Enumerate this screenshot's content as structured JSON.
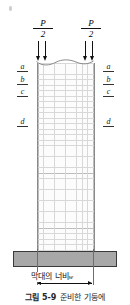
{
  "figure": {
    "title_caption": {
      "number": "그림 5-9",
      "text": "준비한 기둥에"
    },
    "loads": [
      {
        "id": "load-left",
        "numerator": "P",
        "denominator": "2"
      },
      {
        "id": "load-right",
        "numerator": "P",
        "denominator": "2"
      }
    ],
    "side_labels_left": [
      {
        "label": "a",
        "rule": "overline"
      },
      {
        "label": "b",
        "rule": "overline"
      },
      {
        "label": "c",
        "rule": "overline"
      },
      {
        "label": "d",
        "rule": "overline"
      }
    ],
    "side_labels_right": [
      {
        "label": "a",
        "rule": "overline"
      },
      {
        "label": "b",
        "rule": "overline"
      },
      {
        "label": "c",
        "rule": "overline"
      },
      {
        "label": "d",
        "rule": "overline"
      }
    ],
    "width_dimension": {
      "label": "막대의 너비",
      "variable": "w"
    },
    "colors": {
      "base_plate_fill": "#a8a8a8",
      "base_plate_border": "#3a3a3a",
      "column_outline": "#8a8a8a",
      "grid_minor": "#d8d8d8",
      "grid_major": "#bcbcbc",
      "arrow": "#111111",
      "background": "#ffffff"
    }
  }
}
